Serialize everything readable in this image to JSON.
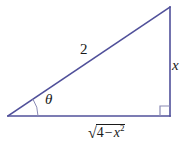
{
  "figure": {
    "background_color": "#ffffff",
    "stroke_color": "#50509a",
    "right_angle_color": "#8a8ab4",
    "text_color": "#1a1a1a"
  },
  "geometry": {
    "vertices": {
      "left": {
        "x": 8,
        "y": 116
      },
      "bottom_right": {
        "x": 170,
        "y": 116
      },
      "top_right": {
        "x": 170,
        "y": 7
      }
    },
    "angle_arc": {
      "center_x": 8,
      "center_y": 116,
      "radius": 30
    },
    "right_angle_square_size": 10
  },
  "labels": {
    "hypotenuse": "2",
    "opposite": "x",
    "angle": "θ",
    "adjacent": {
      "radical_sign": "√",
      "radicand_number": "4",
      "operator": "−",
      "radicand_variable": "x",
      "exponent": "2",
      "plain_text": "√(4 − x²)"
    }
  }
}
